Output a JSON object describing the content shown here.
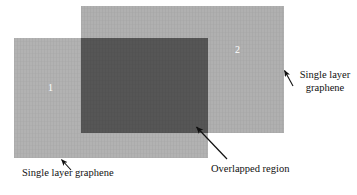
{
  "figure": {
    "type": "schematic-diagram",
    "background_color": "#ffffff"
  },
  "sheets": [
    {
      "id": "sheet-1",
      "number_label": "1",
      "color": "#b2b2b2",
      "number_color": "#ffffff"
    },
    {
      "id": "sheet-2",
      "number_label": "2",
      "color": "#b0b0b0",
      "number_color": "#ffffff"
    }
  ],
  "overlap": {
    "id": "overlap-region",
    "color": "#565656"
  },
  "annotations": {
    "left_label": "Single layer graphene",
    "right_label_line1": "Single layer",
    "right_label_line2": "graphene",
    "overlap_label": "Overlapped region",
    "arrow_color": "#111111"
  }
}
